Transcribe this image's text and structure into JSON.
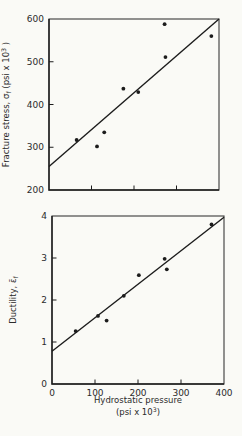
{
  "figure": {
    "background": "#fafaf6",
    "ink": "#1c1c1c",
    "axis_color": "#3a3a3a",
    "text_color": "#2b2b2b"
  },
  "chart_data": [
    {
      "type": "scatter",
      "id": "fracture-stress",
      "ylabel_segments": [
        {
          "t": "Fracture stress, "
        },
        {
          "t": "σ"
        },
        {
          "t": "f",
          "style": "sub"
        },
        {
          "t": " (psi x 10"
        },
        {
          "t": "3",
          "style": "sup"
        },
        {
          "t": " )"
        }
      ],
      "xlabel_lines": [],
      "xlim": [
        0,
        400
      ],
      "ylim": [
        200,
        600
      ],
      "xticks": [
        100,
        200,
        300
      ],
      "show_xtick_labels": false,
      "yticks": [
        200,
        300,
        400,
        500,
        600
      ],
      "show_ytick_labels": true,
      "grid": false,
      "marker": "filled-circle",
      "points": [
        [
          65,
          317
        ],
        [
          113,
          302
        ],
        [
          130,
          335
        ],
        [
          175,
          437
        ],
        [
          210,
          429
        ],
        [
          272,
          588
        ],
        [
          274,
          511
        ],
        [
          382,
          560
        ]
      ],
      "fit_line": {
        "x1": 0,
        "y1": 255,
        "x2": 400,
        "y2": 600
      }
    },
    {
      "type": "scatter",
      "id": "ductility",
      "ylabel_segments": [
        {
          "t": "Ductility, "
        },
        {
          "t": "ε̄"
        },
        {
          "t": "f",
          "style": "sub"
        }
      ],
      "xlabel_lines": [
        [
          {
            "t": "Hydrostatic pressure"
          }
        ],
        [
          {
            "t": "(psi x 10"
          },
          {
            "t": "3",
            "style": "sup"
          },
          {
            "t": ")"
          }
        ]
      ],
      "xlim": [
        0,
        400
      ],
      "ylim": [
        0,
        4
      ],
      "xticks": [
        0,
        100,
        200,
        300,
        400
      ],
      "show_xtick_labels": true,
      "yticks": [
        0,
        1,
        2,
        3,
        4
      ],
      "show_ytick_labels": true,
      "grid": false,
      "marker": "filled-circle",
      "points": [
        [
          55,
          1.26
        ],
        [
          107,
          1.62
        ],
        [
          127,
          1.51
        ],
        [
          167,
          2.1
        ],
        [
          202,
          2.59
        ],
        [
          262,
          2.98
        ],
        [
          267,
          2.73
        ],
        [
          371,
          3.8
        ]
      ],
      "fit_line": {
        "x1": 0,
        "y1": 0.78,
        "x2": 400,
        "y2": 3.97
      }
    }
  ]
}
